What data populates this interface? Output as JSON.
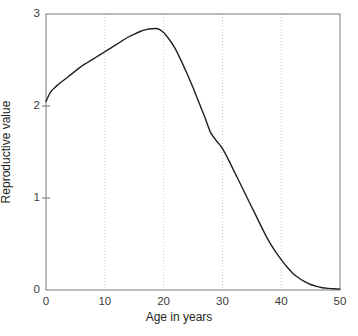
{
  "chart_data": {
    "type": "line",
    "title": "",
    "xlabel": "Age in years",
    "ylabel": "Reproductive value",
    "xlim": [
      0,
      50
    ],
    "ylim": [
      0,
      3
    ],
    "xticks": [
      "0",
      "10",
      "20",
      "30",
      "40",
      "50"
    ],
    "xtick_values": [
      0,
      10,
      20,
      30,
      40,
      50
    ],
    "yticks": [
      "0",
      "1",
      "2",
      "3"
    ],
    "ytick_values": [
      0,
      1,
      2,
      3
    ],
    "grid": {
      "vertical": true,
      "horizontal": false,
      "style": "dotted",
      "color": "#c9c9c9",
      "at": [
        10,
        20,
        30,
        40
      ]
    },
    "legend": null,
    "series": [
      {
        "name": "Reproductive value",
        "color": "#231f20",
        "line_width": 1.4,
        "x": [
          0,
          0.5,
          1,
          1.5,
          2,
          3,
          4,
          5,
          6,
          7,
          8,
          9,
          10,
          11,
          12,
          13,
          14,
          15,
          16,
          17,
          18,
          19,
          20,
          21,
          22,
          23,
          24,
          25,
          26,
          27,
          28,
          29,
          30,
          31,
          32,
          33,
          34,
          35,
          36,
          37,
          38,
          39,
          40,
          41,
          42,
          43,
          44,
          45,
          46,
          47,
          48,
          49,
          50
        ],
        "y": [
          2.05,
          2.12,
          2.17,
          2.2,
          2.23,
          2.28,
          2.33,
          2.38,
          2.43,
          2.47,
          2.51,
          2.55,
          2.59,
          2.63,
          2.67,
          2.71,
          2.75,
          2.78,
          2.81,
          2.83,
          2.84,
          2.84,
          2.8,
          2.72,
          2.62,
          2.49,
          2.35,
          2.2,
          2.04,
          1.88,
          1.71,
          1.62,
          1.54,
          1.42,
          1.29,
          1.16,
          1.03,
          0.9,
          0.77,
          0.64,
          0.52,
          0.42,
          0.33,
          0.25,
          0.18,
          0.13,
          0.09,
          0.06,
          0.04,
          0.025,
          0.018,
          0.013,
          0.01
        ]
      }
    ]
  },
  "axes": {
    "frame_color": "#6e6e6e",
    "tick_color": "#6e6e6e"
  }
}
